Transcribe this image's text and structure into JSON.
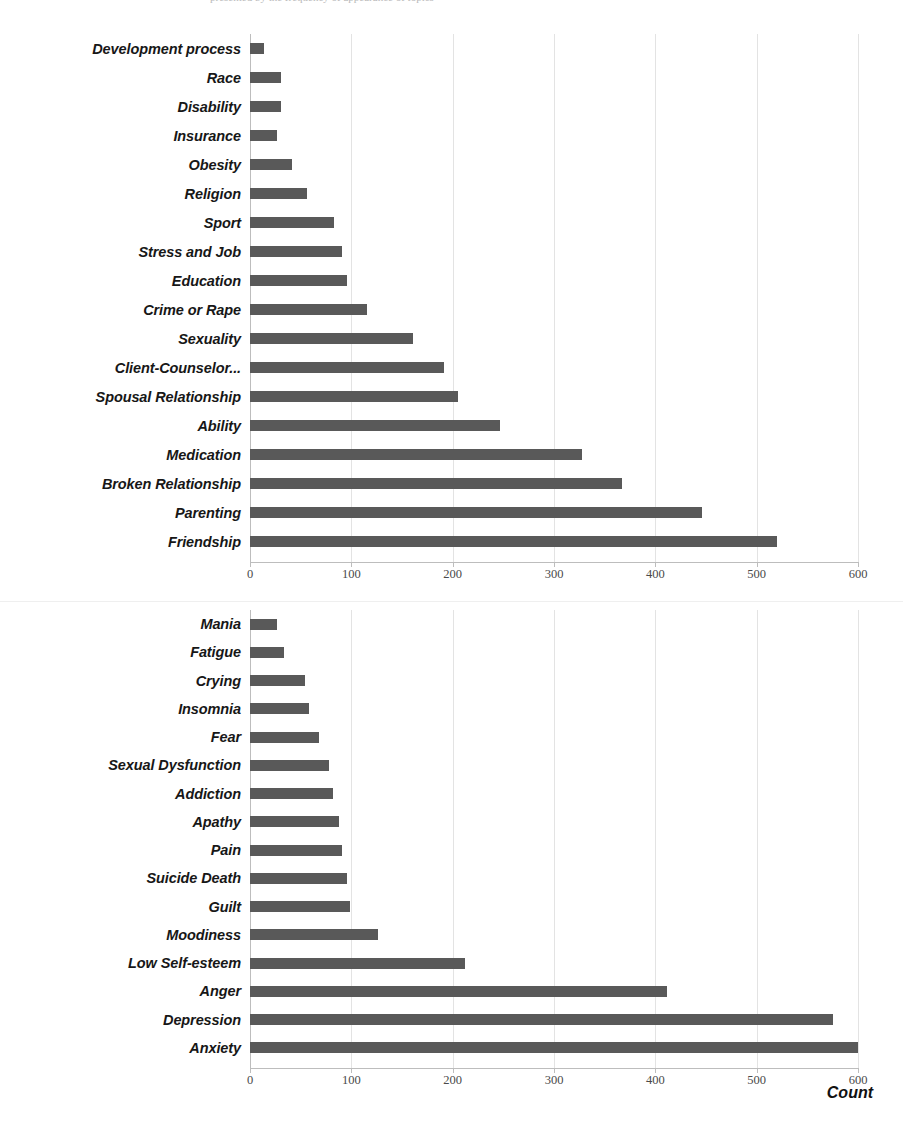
{
  "page": {
    "background_color": "#ffffff",
    "bar_color": "#595959",
    "gridline_color": "#e3e3e3",
    "top_cut_caption": "presented by the frequency of appearance of topics"
  },
  "chart_data": [
    {
      "id": "topics",
      "type": "bar",
      "orientation": "horizontal",
      "title": "",
      "xlabel": "",
      "ylabel": "",
      "xlim": [
        0,
        600
      ],
      "xticks": [
        0,
        100,
        200,
        300,
        400,
        500,
        600
      ],
      "grid": true,
      "legend": "none",
      "categories": [
        "Development process",
        "Race",
        "Disability",
        "Insurance",
        "Obesity",
        "Religion",
        "Sport",
        "Stress and Job",
        "Education",
        "Crime or Rape",
        "Sexuality",
        "Client-Counselor...",
        "Spousal Relationship",
        "Ability",
        "Medication",
        "Broken Relationship",
        "Parenting",
        "Friendship"
      ],
      "values": [
        14,
        31,
        31,
        27,
        41,
        56,
        83,
        91,
        96,
        115,
        161,
        191,
        205,
        247,
        328,
        367,
        446,
        520
      ]
    },
    {
      "id": "symptoms",
      "type": "bar",
      "orientation": "horizontal",
      "title": "",
      "xlabel": "Count",
      "ylabel": "",
      "xlim": [
        0,
        600
      ],
      "xticks": [
        0,
        100,
        200,
        300,
        400,
        500,
        600
      ],
      "grid": true,
      "legend": "none",
      "categories": [
        "Mania",
        "Fatigue",
        "Crying",
        "Insomnia",
        "Fear",
        "Sexual Dysfunction",
        "Addiction",
        "Apathy",
        "Pain",
        "Suicide Death",
        "Guilt",
        "Moodiness",
        "Low Self-esteem",
        "Anger",
        "Depression",
        "Anxiety"
      ],
      "values": [
        27,
        34,
        54,
        58,
        68,
        78,
        82,
        88,
        91,
        96,
        99,
        126,
        212,
        412,
        575,
        633
      ]
    }
  ]
}
